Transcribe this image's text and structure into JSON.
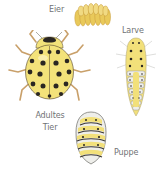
{
  "diagram": {
    "stages": [
      {
        "id": "eggs",
        "label": "Eier"
      },
      {
        "id": "larva",
        "label": "Larve"
      },
      {
        "id": "adult",
        "label_line1": "Adultes",
        "label_line2": "Tier"
      },
      {
        "id": "pupa",
        "label": "Puppe"
      }
    ],
    "colors": {
      "background": "#ffffff",
      "label_text": "#707274",
      "body_yellow": "#f3e27a",
      "egg_yellow": "#e9c95a",
      "spot_black": "#2a2622",
      "leg_tan": "#c9a06a",
      "segment_white": "#eeeeea",
      "segment_gray": "#9a9a98"
    }
  }
}
